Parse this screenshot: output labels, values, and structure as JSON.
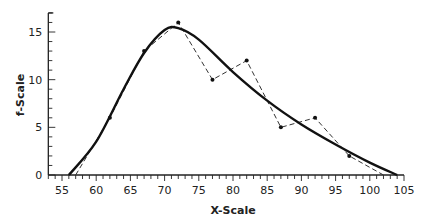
{
  "chart_data": {
    "type": "line",
    "title": "",
    "xlabel": "X-Scale",
    "ylabel": "f-Scale",
    "xlim": [
      53,
      105
    ],
    "ylim": [
      0,
      17
    ],
    "grid": false,
    "legend": null,
    "x_ticks": [
      55,
      60,
      65,
      70,
      75,
      80,
      85,
      90,
      95,
      100,
      105
    ],
    "y_ticks": [
      0,
      5,
      10,
      15
    ],
    "series": [
      {
        "name": "frequency polygon",
        "style": "dashed",
        "markers": true,
        "x": [
          57,
          62,
          67,
          72,
          77,
          82,
          87,
          92,
          97,
          102
        ],
        "y": [
          0,
          6,
          13,
          16,
          10,
          12,
          5,
          6,
          2,
          0
        ]
      },
      {
        "name": "smoothed curve",
        "style": "solid-bold",
        "markers": false,
        "x": [
          56,
          60,
          64,
          67,
          70,
          72,
          75,
          80,
          85,
          90,
          95,
          100,
          104
        ],
        "y": [
          0,
          3.5,
          9,
          12.8,
          15.2,
          15.4,
          14.2,
          10.8,
          7.8,
          5.3,
          3.2,
          1.3,
          0
        ]
      }
    ]
  }
}
